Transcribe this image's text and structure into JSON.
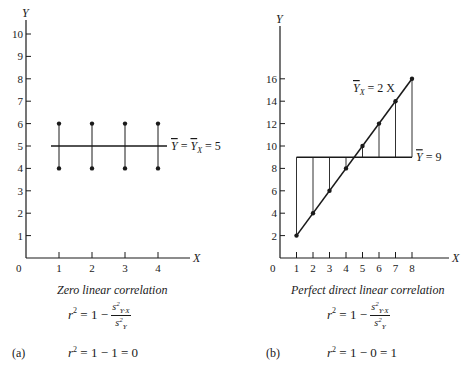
{
  "chart_data": [
    {
      "panel": "(a)",
      "type": "scatter",
      "title": "Zero linear correlation",
      "xlabel": "X",
      "ylabel": "Y",
      "xlim": [
        0,
        4.5
      ],
      "ylim": [
        0,
        10
      ],
      "x_ticks": [
        1,
        2,
        3,
        4
      ],
      "y_ticks": [
        1,
        2,
        3,
        4,
        5,
        6,
        7,
        8,
        9,
        10
      ],
      "points": [
        {
          "x": 1,
          "y": 6
        },
        {
          "x": 1,
          "y": 4
        },
        {
          "x": 2,
          "y": 6
        },
        {
          "x": 2,
          "y": 4
        },
        {
          "x": 3,
          "y": 6
        },
        {
          "x": 3,
          "y": 4
        },
        {
          "x": 4,
          "y": 6
        },
        {
          "x": 4,
          "y": 4
        }
      ],
      "regression_line": {
        "label": "Ȳ = Ȳ_X = 5",
        "y": 5
      },
      "formula": [
        "r² = 1 − s²_{Y·X} / s²_Y",
        "r² = 1 − 1 = 0"
      ]
    },
    {
      "panel": "(b)",
      "type": "scatter",
      "title": "Perfect direct linear correlation",
      "xlabel": "X",
      "ylabel": "Y",
      "xlim": [
        0,
        8.5
      ],
      "ylim": [
        0,
        20
      ],
      "x_ticks": [
        1,
        2,
        3,
        4,
        5,
        6,
        7,
        8
      ],
      "y_ticks": [
        2,
        4,
        6,
        8,
        10,
        12,
        14,
        16
      ],
      "points": [
        {
          "x": 1,
          "y": 2
        },
        {
          "x": 2,
          "y": 4
        },
        {
          "x": 3,
          "y": 6
        },
        {
          "x": 4,
          "y": 8
        },
        {
          "x": 5,
          "y": 10
        },
        {
          "x": 6,
          "y": 12
        },
        {
          "x": 7,
          "y": 14
        },
        {
          "x": 8,
          "y": 16
        }
      ],
      "regression_line": {
        "label": "Ȳ_X = 2 X",
        "slope": 2,
        "intercept": 0
      },
      "mean_line": {
        "label": "Ȳ = 9",
        "y": 9
      },
      "formula": [
        "r² = 1 − s²_{Y·X} / s²_Y",
        "r² = 1 − 0 = 1"
      ]
    }
  ],
  "labels": {
    "a": {
      "panel": "(a)",
      "caption": "Zero linear correlation",
      "line_label_text": "= 5",
      "eq_r2": "r",
      "eq_rest": " = 1 − ",
      "eq2_rest": " = 1 − 1 = 0",
      "num": "s",
      "den": "s",
      "axis_x": "X",
      "axis_y": "Y",
      "origin": "0"
    },
    "b": {
      "panel": "(b)",
      "caption": "Perfect direct linear correlation",
      "reg_label_text": "= 2 X",
      "mean_label_text": "= 9",
      "eq_r2": "r",
      "eq_rest": " = 1 − ",
      "eq2_rest": " = 1 − 0 = 1",
      "num": "s",
      "den": "s",
      "axis_x": "X",
      "axis_y": "Y",
      "origin": "0"
    }
  }
}
